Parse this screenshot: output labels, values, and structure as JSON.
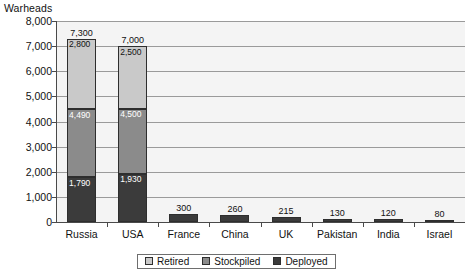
{
  "chart_data": {
    "type": "bar",
    "subtype": "stacked-bar",
    "title": "",
    "xlabel": "",
    "ylabel": "Warheads",
    "ylim": [
      0,
      8000
    ],
    "ytick_labels": [
      "8,000",
      "7,000",
      "6,000",
      "5,000",
      "4,000",
      "3,000",
      "2,000",
      "1,000",
      "0"
    ],
    "ytick_values": [
      8000,
      7000,
      6000,
      5000,
      4000,
      3000,
      2000,
      1000,
      0
    ],
    "grid": true,
    "legend_position": "bottom",
    "categories": [
      "Russia",
      "USA",
      "France",
      "China",
      "UK",
      "Pakistan",
      "India",
      "Israel"
    ],
    "series": [
      {
        "name": "Deployed",
        "color": "#3b3b3b",
        "values": [
          1790,
          1930,
          300,
          260,
          215,
          130,
          120,
          80
        ]
      },
      {
        "name": "Stockpiled",
        "color": "#8b8b8b",
        "values": [
          2700,
          2570,
          0,
          0,
          0,
          0,
          0,
          0
        ]
      },
      {
        "name": "Retired",
        "color": "#c9c9c9",
        "values": [
          2810,
          2500,
          0,
          0,
          0,
          0,
          0,
          0
        ]
      }
    ],
    "totals": [
      7300,
      7000,
      300,
      260,
      215,
      130,
      120,
      80
    ],
    "annotations": {
      "Russia": {
        "deployed_label": "1,790",
        "stockpiled_cumulative_label": "4,490",
        "retired_label": "2,800",
        "total_label": "7,300"
      },
      "USA": {
        "deployed_label": "1,930",
        "stockpiled_cumulative_label": "4,500",
        "retired_label": "2,500",
        "total_label": "7,000"
      },
      "France": {
        "total_label": "300"
      },
      "China": {
        "total_label": "260"
      },
      "UK": {
        "total_label": "215"
      },
      "Pakistan": {
        "total_label": "130"
      },
      "India": {
        "total_label": "120"
      },
      "Israel": {
        "total_label": "80"
      }
    }
  },
  "legend": {
    "items": [
      {
        "label": "Retired",
        "color": "#c9c9c9"
      },
      {
        "label": "Stockpiled",
        "color": "#8b8b8b"
      },
      {
        "label": "Deployed",
        "color": "#3b3b3b"
      }
    ]
  },
  "colors": {
    "retired": "#c9c9c9",
    "stockpiled": "#8b8b8b",
    "deployed": "#3b3b3b",
    "plot_background": "#f4f4f4",
    "gridline": "#9a9a9a",
    "axis": "#4a4a4a"
  }
}
